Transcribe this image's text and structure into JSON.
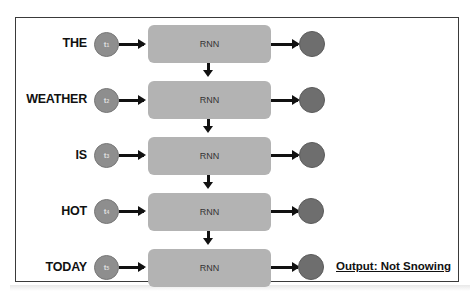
{
  "diagram": {
    "type": "RNN unrolled sequence classification",
    "rows": [
      {
        "word": "THE",
        "input": "t",
        "sub": "1",
        "cell": "RNN"
      },
      {
        "word": "WEATHER",
        "input": "t",
        "sub": "2",
        "cell": "RNN"
      },
      {
        "word": "IS",
        "input": "t",
        "sub": "3",
        "cell": "RNN"
      },
      {
        "word": "HOT",
        "input": "t",
        "sub": "4",
        "cell": "RNN"
      },
      {
        "word": "TODAY",
        "input": "t",
        "sub": "5",
        "cell": "RNN"
      }
    ],
    "output_label": "Output: Not Snowing",
    "colors": {
      "rnn_box": "#b3b3b3",
      "input_circle": "#8e8e8e",
      "output_circle": "#6e6e6e",
      "arrow": "#111111",
      "frame": "#3a3a3a"
    }
  }
}
